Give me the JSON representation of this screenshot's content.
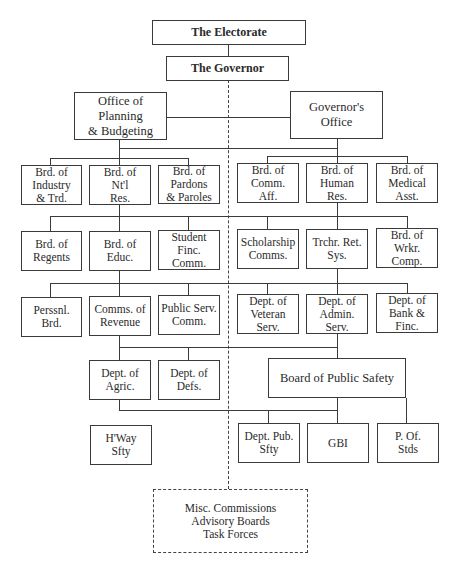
{
  "diagram": {
    "nodes": {
      "electorate": "The Electorate",
      "governor": "The Governor",
      "opb": "Office of Planning\n& Budgeting",
      "gov_office": "Governor's\nOffice",
      "row1_left": [
        "Brd. of\nIndustry\n& Trd.",
        "Brd. of\nNt'l\nRes.",
        "Brd. of\nPardons\n& Paroles"
      ],
      "row1_right": [
        "Brd. of\nComm.\nAff.",
        "Brd. of\nHuman\nRes.",
        "Brd. of\nMedical\nAsst."
      ],
      "row2_left": [
        "Brd. of\nRegents",
        "Brd. of\nEduc.",
        "Student\nFinc.\nComm."
      ],
      "row2_right": [
        "Scholarship\nComms.",
        "Trchr. Ret.\nSys.",
        "Brd. of Wrkr.\nComp."
      ],
      "row3_left": [
        "Perssnl. Brd.",
        "Comms. of\nRevenue",
        "Public Serv.\nComm."
      ],
      "row3_right": [
        "Dept. of\nVeteran Serv.",
        "Dept. of\nAdmin. Serv.",
        "Dept. of\nBank & Finc."
      ],
      "row4_left": [
        "Dept. of\nAgric.",
        "Dept. of\nDefs."
      ],
      "bps": "Board of Public Safety",
      "row5_left": [
        "H'Way\nSfty"
      ],
      "row5_right": [
        "Dept. Pub.\nSfty",
        "GBI",
        "P. Of.\nStds"
      ],
      "misc": "Misc. Commissions\nAdvisory Boards\nTask Forces"
    },
    "edges": [
      [
        "The Electorate",
        "The Governor",
        "solid"
      ],
      [
        "The Governor",
        "Misc. Commissions / Advisory Boards / Task Forces",
        "dashed"
      ],
      [
        "Office of Planning & Budgeting",
        "Governor's Office",
        "solid"
      ],
      [
        "Office of Planning & Budgeting",
        "Boards / Departments rows",
        "solid"
      ],
      [
        "Governor's Office",
        "Boards / Departments rows",
        "solid"
      ],
      [
        "Board of Public Safety",
        "Dept. Pub. Sfty",
        "solid"
      ],
      [
        "Board of Public Safety",
        "GBI",
        "solid"
      ],
      [
        "Board of Public Safety",
        "P. Of. Stds",
        "solid"
      ]
    ]
  }
}
